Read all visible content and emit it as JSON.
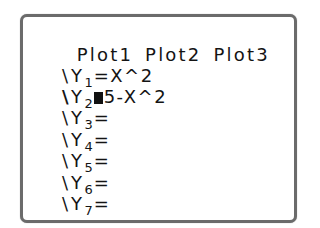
{
  "screen": {
    "plots": [
      {
        "label": "Plot1"
      },
      {
        "label": "Plot2"
      },
      {
        "label": "Plot3"
      }
    ],
    "equations": [
      {
        "marker": "\\",
        "selected": false,
        "name": "Y",
        "index": "1",
        "sep": "=",
        "expr": "X^2"
      },
      {
        "marker": "\\",
        "selected": true,
        "name": "Y",
        "index": "2",
        "sep": "",
        "expr": "5-X^2",
        "cursor": true
      },
      {
        "marker": "\\",
        "selected": false,
        "name": "Y",
        "index": "3",
        "sep": "=",
        "expr": ""
      },
      {
        "marker": "\\",
        "selected": false,
        "name": "Y",
        "index": "4",
        "sep": "=",
        "expr": ""
      },
      {
        "marker": "\\",
        "selected": false,
        "name": "Y",
        "index": "5",
        "sep": "=",
        "expr": ""
      },
      {
        "marker": "\\",
        "selected": false,
        "name": "Y",
        "index": "6",
        "sep": "=",
        "expr": ""
      },
      {
        "marker": "\\",
        "selected": false,
        "name": "Y",
        "index": "7",
        "sep": "=",
        "expr": ""
      }
    ],
    "colors": {
      "text": "#141414",
      "frame": "#6b6b6b",
      "background": "#ffffff",
      "cursor": "#111111"
    }
  }
}
